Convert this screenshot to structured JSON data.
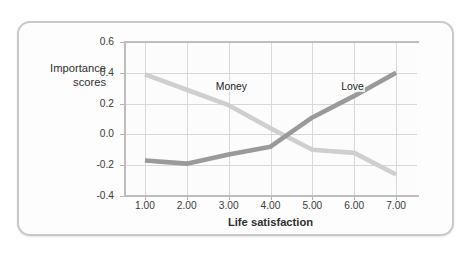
{
  "figure": {
    "y_axis_title_line1": "Importance",
    "y_axis_title_line2": "scores",
    "x_axis_title": "Life satisfaction"
  },
  "colors": {
    "money_line": "#cfcfcf",
    "love_line": "#9a9a9a",
    "grid": "#d8d8d8",
    "axis": "#bdbdbd",
    "frame": "#c9c9c9",
    "text": "#2f2f2f"
  },
  "chart_data": {
    "type": "line",
    "title": "",
    "xlabel": "Life satisfaction",
    "ylabel": "Importance scores",
    "x": [
      1.0,
      2.0,
      3.0,
      4.0,
      5.0,
      6.0,
      7.0
    ],
    "xtick_labels": [
      "1.00",
      "2.00",
      "3.00",
      "4.00",
      "5.00",
      "6.00",
      "7.00"
    ],
    "ytick_labels": [
      "0.6",
      "0.4",
      "0.2",
      "0.0",
      "-0.2",
      "-0.4"
    ],
    "ytick_values": [
      0.6,
      0.4,
      0.2,
      0.0,
      -0.2,
      -0.4
    ],
    "xlim": [
      0.5,
      7.5
    ],
    "ylim": [
      -0.4,
      0.6
    ],
    "grid": true,
    "legend": "inline-labels",
    "series": [
      {
        "name": "Money",
        "color": "#cfcfcf",
        "label_x": 3.1,
        "values": [
          0.39,
          0.29,
          0.19,
          0.04,
          -0.1,
          -0.12,
          -0.26
        ]
      },
      {
        "name": "Love",
        "color": "#9a9a9a",
        "label_x": 6.0,
        "values": [
          -0.17,
          -0.19,
          -0.13,
          -0.08,
          0.11,
          0.25,
          0.4
        ]
      }
    ],
    "annotations": [
      {
        "text": "Money",
        "x": 3.1,
        "y": 0.3
      },
      {
        "text": "Love",
        "x": 6.0,
        "y": 0.3
      }
    ]
  }
}
